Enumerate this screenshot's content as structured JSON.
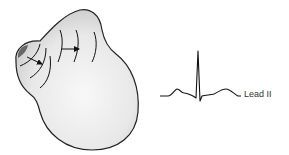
{
  "figure": {
    "heart": {
      "fill_light": "#f4f4f4",
      "fill_dark": "#d2d2d2",
      "outline_color": "#222222",
      "sa_node_color": "#666666",
      "arrow_color": "#111111"
    },
    "ecg": {
      "label": "Lead II",
      "trace_color": "#111111",
      "label_color": "#333333"
    }
  }
}
